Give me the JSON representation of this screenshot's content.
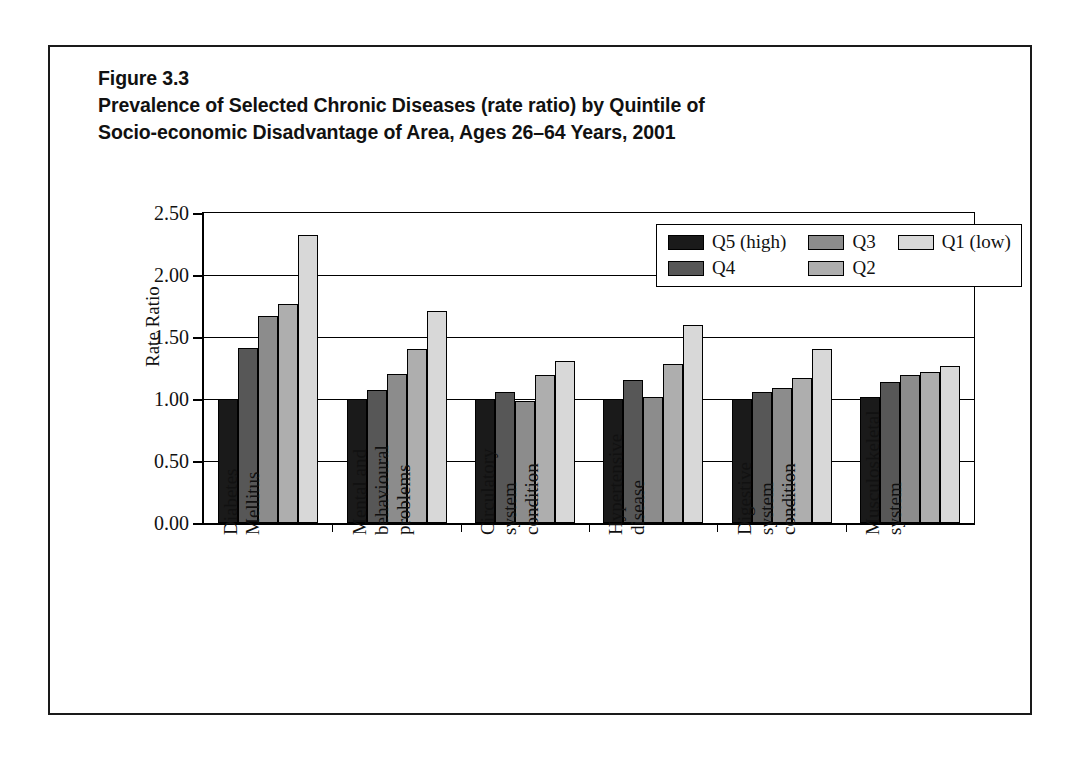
{
  "figure": {
    "number": "Figure 3.3",
    "title_line_1": "Prevalence of Selected Chronic Diseases (rate ratio) by Quintile of",
    "title_line_2": "Socio-economic Disadvantage of Area, Ages 26–64 Years, 2001"
  },
  "chart_data": {
    "type": "bar",
    "title": "Prevalence of Selected Chronic Diseases (rate ratio) by Quintile of Socio-economic Disadvantage of Area, Ages 26–64 Years, 2001",
    "xlabel": "",
    "ylabel": "Rate Ratio",
    "ylim": [
      0.0,
      2.5
    ],
    "ytick_labels": [
      "0.00",
      "0.50",
      "1.00",
      "1.50",
      "2.00",
      "2.50"
    ],
    "ytick_values": [
      0.0,
      0.5,
      1.0,
      1.5,
      2.0,
      2.5
    ],
    "grid": true,
    "legend_position": "top-right-inside",
    "categories": [
      "Diabetes Mellitus",
      "Mental and behavioural problems",
      "Circulatory system condition",
      "Hypertensive disease",
      "Digestive system condition",
      "Musculoskeletal system"
    ],
    "category_label_lines": [
      [
        "Diabetes",
        "Mellitus"
      ],
      [
        "Mental and",
        "behavioural",
        "problems"
      ],
      [
        "Circulatory",
        "system",
        "condition"
      ],
      [
        "Hypertensive",
        "disease"
      ],
      [
        "Digestive",
        "system",
        "condition"
      ],
      [
        "Musculoskeletal",
        "system"
      ]
    ],
    "series": [
      {
        "name": "Q5 (high)",
        "color": "#1a1a1a",
        "values": [
          1.0,
          1.0,
          1.0,
          1.0,
          1.0,
          1.02
        ]
      },
      {
        "name": "Q4",
        "color": "#575757",
        "values": [
          1.41,
          1.07,
          1.06,
          1.15,
          1.06,
          1.14
        ]
      },
      {
        "name": "Q3",
        "color": "#8c8c8c",
        "values": [
          1.67,
          1.2,
          0.98,
          1.02,
          1.09,
          1.19
        ]
      },
      {
        "name": "Q2",
        "color": "#aeaeae",
        "values": [
          1.77,
          1.4,
          1.19,
          1.28,
          1.17,
          1.22
        ]
      },
      {
        "name": "Q1 (low)",
        "color": "#d8d8d8",
        "values": [
          2.32,
          1.71,
          1.31,
          1.6,
          1.4,
          1.27
        ]
      }
    ]
  },
  "legend": {
    "entries": [
      {
        "label": "Q5 (high)",
        "color": "#1a1a1a"
      },
      {
        "label": "Q3",
        "color": "#8c8c8c"
      },
      {
        "label": "Q1 (low)",
        "color": "#d8d8d8"
      },
      {
        "label": "Q4",
        "color": "#575757"
      },
      {
        "label": "Q2",
        "color": "#aeaeae"
      }
    ]
  }
}
